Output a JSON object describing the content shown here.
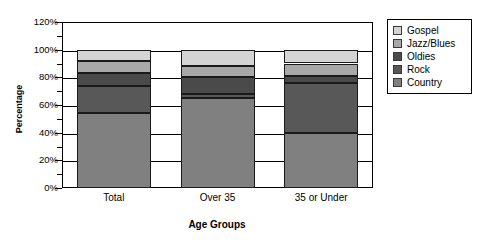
{
  "chart_data": {
    "type": "bar",
    "subtype": "stacked-bar-100-percent",
    "title": "",
    "xlabel": "Age Groups",
    "ylabel": "Percentage",
    "categories": [
      "Total",
      "Over 35",
      "35 or Under"
    ],
    "ylim": [
      0,
      120
    ],
    "ytick_step": 20,
    "ytick_labels": [
      "0%",
      "20%",
      "40%",
      "60%",
      "80%",
      "100%",
      "120%"
    ],
    "ytick_values": [
      0,
      20,
      40,
      60,
      80,
      100,
      120
    ],
    "minor_ticks": true,
    "grid": true,
    "legend_position": "right",
    "stack_order_bottom_to_top": [
      "Country",
      "Rock",
      "Oldies",
      "Jazz/Blues",
      "Gospel"
    ],
    "series": [
      {
        "name": "Country",
        "color": "#808080",
        "values": [
          54,
          65,
          40
        ],
        "cumulative_top": [
          54,
          65,
          40
        ]
      },
      {
        "name": "Rock",
        "color": "#585858",
        "values": [
          20,
          3,
          36
        ],
        "cumulative_top": [
          74,
          68,
          76
        ]
      },
      {
        "name": "Oldies",
        "color": "#4a4a4a",
        "values": [
          9,
          12,
          5
        ],
        "cumulative_top": [
          83,
          80,
          81
        ]
      },
      {
        "name": "Jazz/Blues",
        "color": "#a8a8a8",
        "values": [
          9,
          8,
          9
        ],
        "cumulative_top": [
          92,
          88,
          90
        ]
      },
      {
        "name": "Gospel",
        "color": "#d4d4d4",
        "values": [
          8,
          12,
          10
        ],
        "cumulative_top": [
          100,
          100,
          100
        ]
      }
    ]
  },
  "legend": {
    "items": [
      {
        "label": "Gospel",
        "color": "#d4d4d4"
      },
      {
        "label": "Jazz/Blues",
        "color": "#a8a8a8"
      },
      {
        "label": "Oldies",
        "color": "#4a4a4a"
      },
      {
        "label": "Rock",
        "color": "#585858"
      },
      {
        "label": "Country",
        "color": "#808080"
      }
    ]
  },
  "axes": {
    "y_title": "Percentage",
    "x_title": "Age Groups"
  }
}
